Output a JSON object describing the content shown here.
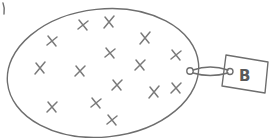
{
  "diagram": {
    "tag": {
      "label": "B"
    },
    "marks": {
      "symbol": "x",
      "count": 15
    },
    "colors": {
      "stroke": "#6e6e6e",
      "mark": "#7a7a7a",
      "label": "#5a5a5a",
      "background": "#ffffff"
    }
  }
}
